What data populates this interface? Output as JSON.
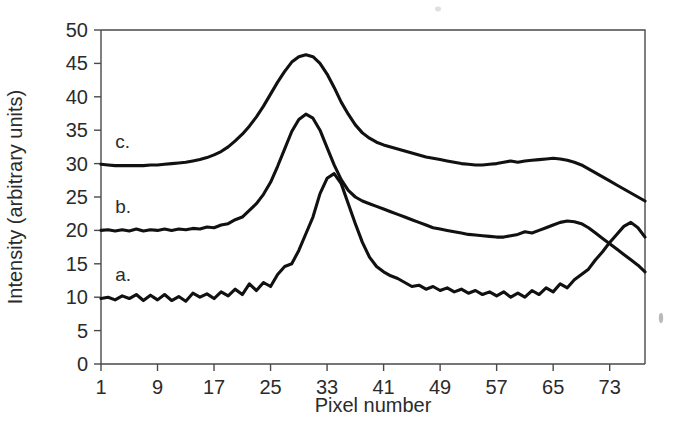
{
  "figure": {
    "background_color": "#ffffff",
    "line_color": "#111111",
    "axis_color": "#4a4a4a",
    "text_color": "#2b2b2b"
  },
  "axes": {
    "x_title": "Pixel number",
    "y_title": "Intensity (arbitrary units)",
    "x_ticks": [
      "1",
      "9",
      "17",
      "25",
      "33",
      "41",
      "49",
      "57",
      "65",
      "73"
    ],
    "y_ticks": [
      "0",
      "5",
      "10",
      "15",
      "20",
      "25",
      "30",
      "35",
      "40",
      "45",
      "50"
    ]
  },
  "curve_labels": {
    "a": "a.",
    "b": "b.",
    "c": "c."
  },
  "chart_data": {
    "type": "line",
    "title": "",
    "xlabel": "Pixel number",
    "ylabel": "Intensity (arbitrary units)",
    "xlim": [
      1,
      78
    ],
    "ylim": [
      0,
      50
    ],
    "xticks": [
      1,
      9,
      17,
      25,
      33,
      41,
      49,
      57,
      65,
      73
    ],
    "yticks": [
      0,
      5,
      10,
      15,
      20,
      25,
      30,
      35,
      40,
      45,
      50
    ],
    "grid": false,
    "legend": "inline-labels",
    "annotations": [
      {
        "text": "a.",
        "x": 3,
        "y": 12.4
      },
      {
        "text": "b.",
        "x": 3,
        "y": 22.6
      },
      {
        "text": "c.",
        "x": 3,
        "y": 32.4
      }
    ],
    "x": [
      1,
      2,
      3,
      4,
      5,
      6,
      7,
      8,
      9,
      10,
      11,
      12,
      13,
      14,
      15,
      16,
      17,
      18,
      19,
      20,
      21,
      22,
      23,
      24,
      25,
      26,
      27,
      28,
      29,
      30,
      31,
      32,
      33,
      34,
      35,
      36,
      37,
      38,
      39,
      40,
      41,
      42,
      43,
      44,
      45,
      46,
      47,
      48,
      49,
      50,
      51,
      52,
      53,
      54,
      55,
      56,
      57,
      58,
      59,
      60,
      61,
      62,
      63,
      64,
      65,
      66,
      67,
      68,
      69,
      70,
      71,
      72,
      73,
      74,
      75,
      76,
      77,
      78
    ],
    "series": [
      {
        "name": "a",
        "offset": 0,
        "peak_main": {
          "x": 22,
          "y": 28.5
        },
        "peak_secondary": {
          "x": 56,
          "y": 21.2
        },
        "values": [
          9.8,
          10.0,
          9.6,
          10.2,
          9.8,
          10.4,
          9.5,
          10.3,
          9.6,
          10.4,
          9.5,
          10.1,
          9.4,
          10.6,
          10.0,
          10.5,
          9.8,
          10.8,
          10.2,
          11.2,
          10.4,
          12.0,
          11.0,
          12.2,
          11.6,
          13.4,
          14.6,
          15.0,
          17.0,
          19.5,
          22.0,
          25.5,
          27.8,
          28.5,
          27.0,
          24.0,
          21.0,
          18.2,
          16.0,
          14.6,
          13.8,
          13.2,
          12.8,
          12.2,
          11.6,
          11.8,
          11.2,
          11.6,
          11.0,
          11.4,
          10.8,
          11.2,
          10.6,
          11.0,
          10.4,
          10.8,
          10.2,
          10.8,
          10.0,
          10.6,
          10.0,
          11.0,
          10.4,
          11.4,
          10.8,
          12.0,
          11.4,
          12.6,
          13.4,
          14.2,
          15.6,
          16.8,
          18.2,
          19.4,
          20.6,
          21.2,
          20.4,
          19.0
        ]
      },
      {
        "name": "b",
        "offset": 20,
        "peak_main": {
          "x": 22,
          "y": 37.4
        },
        "peak_secondary": {
          "x": 56,
          "y": 21.4
        },
        "values": [
          20.0,
          20.1,
          19.9,
          20.1,
          19.9,
          20.2,
          19.9,
          20.1,
          20.0,
          20.2,
          20.0,
          20.2,
          20.1,
          20.3,
          20.2,
          20.5,
          20.4,
          20.8,
          21.0,
          21.6,
          22.0,
          23.0,
          24.0,
          25.4,
          27.2,
          29.6,
          32.2,
          34.8,
          36.6,
          37.4,
          36.8,
          35.0,
          32.4,
          29.8,
          27.6,
          26.0,
          25.0,
          24.4,
          24.0,
          23.6,
          23.2,
          22.8,
          22.4,
          22.0,
          21.6,
          21.2,
          20.8,
          20.4,
          20.2,
          20.0,
          19.8,
          19.6,
          19.4,
          19.3,
          19.2,
          19.1,
          19.0,
          19.0,
          19.2,
          19.4,
          19.8,
          19.6,
          20.0,
          20.4,
          20.8,
          21.2,
          21.4,
          21.3,
          21.0,
          20.4,
          19.6,
          18.8,
          18.0,
          17.2,
          16.4,
          15.6,
          14.8,
          13.8
        ]
      },
      {
        "name": "c",
        "offset": 30,
        "peak_main": {
          "x": 22,
          "y": 46.3
        },
        "peak_secondary": {
          "x": 56,
          "y": 30.8
        },
        "values": [
          29.9,
          29.8,
          29.7,
          29.7,
          29.7,
          29.7,
          29.7,
          29.8,
          29.8,
          29.9,
          30.0,
          30.1,
          30.2,
          30.4,
          30.6,
          30.9,
          31.3,
          31.8,
          32.5,
          33.4,
          34.4,
          35.6,
          37.0,
          38.6,
          40.4,
          42.2,
          43.8,
          45.2,
          46.0,
          46.3,
          46.0,
          45.0,
          43.4,
          41.4,
          39.2,
          37.4,
          35.8,
          34.6,
          33.8,
          33.2,
          32.8,
          32.5,
          32.2,
          31.9,
          31.6,
          31.3,
          31.0,
          30.8,
          30.6,
          30.4,
          30.2,
          30.0,
          29.9,
          29.8,
          29.8,
          29.9,
          30.0,
          30.2,
          30.4,
          30.2,
          30.4,
          30.5,
          30.6,
          30.7,
          30.8,
          30.7,
          30.5,
          30.2,
          29.8,
          29.2,
          28.6,
          28.0,
          27.4,
          26.8,
          26.2,
          25.6,
          25.0,
          24.4
        ]
      }
    ]
  }
}
